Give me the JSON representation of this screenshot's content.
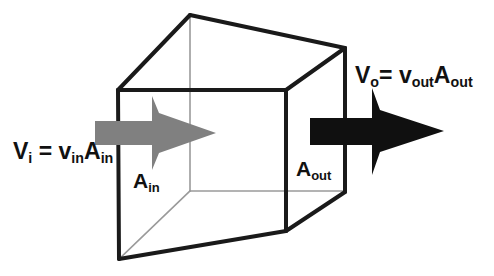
{
  "figure": {
    "background_color": "#ffffff",
    "width": 494,
    "height": 276
  },
  "colors": {
    "cube_visible_edge": "#1a1a1a",
    "cube_hidden_edge": "#9a9a9a",
    "inflow_arrow": "#808080",
    "outflow_arrow": "#101010",
    "text": "#111111"
  },
  "labels": {
    "inflow_equation": {
      "full_text": "Vi = vinAin",
      "v_symbol": "V",
      "v_subscript": "i",
      "equals": "=",
      "velocity_symbol": "v",
      "velocity_subscript": "in",
      "area_symbol": "A",
      "area_subscript": "in"
    },
    "outflow_equation": {
      "full_text": "Vo= voutAout",
      "v_symbol": "V",
      "v_subscript": "o",
      "equals": "=",
      "velocity_symbol": "v",
      "velocity_subscript": "out",
      "area_symbol": "A",
      "area_subscript": "out"
    },
    "inlet_area": {
      "full_text": "Ain",
      "symbol": "A",
      "subscript": "in"
    },
    "outlet_area": {
      "full_text": "Aout",
      "symbol": "A",
      "subscript": "out"
    }
  },
  "cube": {
    "description": "Wireframe cube drawn in oblique perspective",
    "vertices": {
      "front_top_left": [
        118,
        90
      ],
      "front_top_right": [
        286,
        90
      ],
      "front_bottom_left": [
        119,
        259
      ],
      "front_bottom_right": [
        286,
        231
      ],
      "back_top_left": [
        190,
        15
      ],
      "back_top_right": [
        345,
        48
      ],
      "back_bottom_left": [
        190,
        191
      ],
      "back_bottom_right": [
        345,
        192
      ]
    },
    "visible_edges": [
      "front_top_left-front_top_right",
      "front_top_left-front_bottom_left",
      "front_top_right-front_bottom_right",
      "front_bottom_left-front_bottom_right",
      "front_top_left-back_top_left",
      "front_top_right-back_top_right",
      "back_top_left-back_top_right",
      "back_top_right-back_bottom_right",
      "front_bottom_right-back_bottom_right"
    ],
    "hidden_edges": [
      "back_top_left-back_bottom_left",
      "back_bottom_left-back_bottom_right",
      "front_bottom_left-back_bottom_left"
    ]
  },
  "arrows": {
    "inflow": {
      "name": "inflow-arrow",
      "color": "#808080",
      "direction": "right",
      "style": "barbed",
      "tail_start_x": 95,
      "tip_x": 216,
      "center_y": 133
    },
    "outflow": {
      "name": "outflow-arrow",
      "color": "#101010",
      "direction": "right",
      "style": "barbed",
      "tail_start_x": 310,
      "tip_x": 444,
      "center_y": 131
    }
  }
}
